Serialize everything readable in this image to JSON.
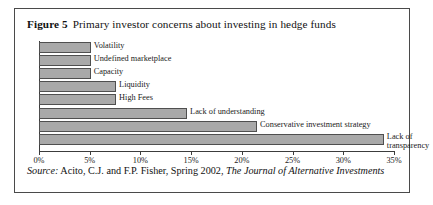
{
  "figure": {
    "number_label": "Figure 5",
    "title": "Primary investor concerns about investing in hedge funds",
    "source_prefix": "Source:",
    "source_text": "Acito, C.J. and F.P. Fisher, Spring 2002,",
    "source_journal": "The Journal of Alternative Investments"
  },
  "chart_data": {
    "type": "bar",
    "orientation": "horizontal",
    "title": "Primary investor concerns about investing in hedge funds",
    "xlabel": "",
    "ylabel": "",
    "xlim": [
      0,
      35
    ],
    "grid": false,
    "legend": "none",
    "tick_labels": [
      "0%",
      "5%",
      "10%",
      "15%",
      "20%",
      "25%",
      "30%",
      "35%"
    ],
    "ticks": [
      0,
      5,
      10,
      15,
      20,
      25,
      30,
      35
    ],
    "categories": [
      "Volatility",
      "Undefined marketplace",
      "Capacity",
      "Liquidity",
      "High Fees",
      "Lack of understanding",
      "Conservative investment strategy",
      "Lack of transparency"
    ],
    "values": [
      5.1,
      5.1,
      5.1,
      7.6,
      7.6,
      14.6,
      21.5,
      34.0
    ],
    "value_unit": "%",
    "bar_color": "#a9a9a9",
    "bar_border_color": "#4f4f4f"
  }
}
